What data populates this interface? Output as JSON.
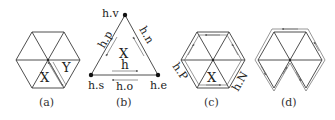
{
  "figure": {
    "panels": [
      {
        "id": "a",
        "caption": "(a)",
        "description": "Hexagonal fan of 6 triangles; two adjacent faces labeled X and Y with a shared edge drawn as paired half-edges",
        "face_labels": [
          "X",
          "Y"
        ]
      },
      {
        "id": "b",
        "caption": "(b)",
        "description": "Single triangle face X with half-edge h and its attributes",
        "face_label": "X",
        "vertex_labels": {
          "top": "h.v",
          "left": "h.s",
          "right": "h.e"
        },
        "edge_labels": {
          "left": "h.p",
          "right": "h.n",
          "bottom_inner": "h",
          "bottom_outer": "h.o"
        }
      },
      {
        "id": "c",
        "caption": "(c)",
        "description": "Hexagonal fan with boundary half-edge loop; face X and labels h.P, h.N",
        "face_label": "X",
        "edge_labels": {
          "left": "h.P",
          "right": "h.N"
        }
      },
      {
        "id": "d",
        "caption": "(d)",
        "description": "Hexagonal fan with two bottom faces removed; boundary half-edge loop around remaining faces"
      }
    ]
  }
}
